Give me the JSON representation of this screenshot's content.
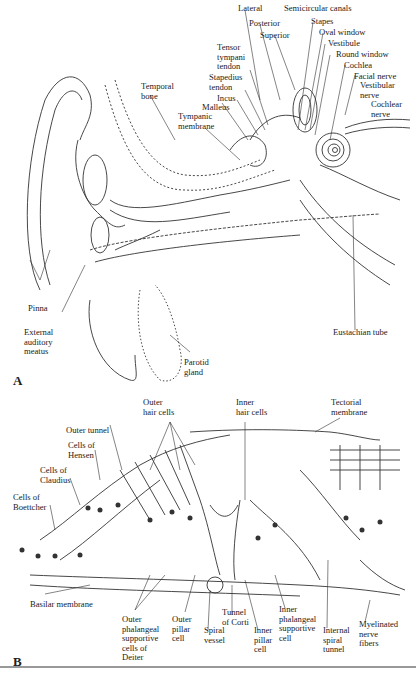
{
  "figure": {
    "panel_a": {
      "letter": "A",
      "labels": {
        "lateral": "Lateral",
        "semicircular_canals": "Semicircular canals",
        "posterior": "Posterior",
        "superior": "Superior",
        "stapes": "Stapes",
        "oval_window": "Oval window",
        "vestibule": "Vestibule",
        "round_window": "Round window",
        "cochlea": "Cochlea",
        "facial_nerve": "Facial nerve",
        "vestibular_nerve": "Vestibular\nnerve",
        "cochlear_nerve": "Cochlear\nnerve",
        "tensor_tympani_tendon": "Tensor\ntympani\ntendon",
        "stapedius_tendon": "Stapedius\ntendon",
        "incus": "Incus",
        "malleus": "Malleus",
        "tympanic_membrane": "Tympanic\nmembrane",
        "temporal_bone": "Temporal\nbone",
        "pinna": "Pinna",
        "external_auditory_meatus": "External\nauditory\nmeatus",
        "parotid_gland": "Parotid\ngland",
        "eustachian_tube": "Eustachian tube"
      }
    },
    "panel_b": {
      "letter": "B",
      "labels": {
        "outer_hair_cells": "Outer\nhair cells",
        "inner_hair_cells": "Inner\nhair cells",
        "tectorial_membrane": "Tectorial\nmembrane",
        "outer_tunnel": "Outer tunnel",
        "cells_of_hensen": "Cells of\nHensen",
        "cells_of_claudius": "Cells of\nClaudius",
        "cells_of_boettcher": "Cells of\nBoettcher",
        "basilar_membrane": "Basilar membrane",
        "outer_phalangeal": "Outer\nphalangeal\nsupportive\ncells of\nDeiter",
        "outer_pillar_cell": "Outer\npillar\ncell",
        "spiral_vessel": "Spiral\nvessel",
        "tunnel_of_corti": "Tunnel\nof Corti",
        "inner_pillar_cell": "Inner\npillar\ncell",
        "inner_phalangeal": "Inner\nphalangeal\nsupportive\ncell",
        "internal_spiral_tunnel": "Internal\nspiral\ntunnel",
        "myelinated_nerve_fibers": "Myelinated\nnerve\nfibers"
      }
    }
  }
}
